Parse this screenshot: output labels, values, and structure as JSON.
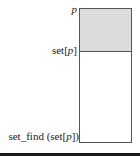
{
  "diagram": {
    "labels": {
      "top": "p",
      "middle_prefix": "set[",
      "middle_var": "p",
      "middle_suffix": "]",
      "bottom_prefix": "set_find (set[",
      "bottom_var": "p",
      "bottom_suffix": "])"
    },
    "colors": {
      "shaded": "#dcdcdc",
      "border": "#555555"
    }
  }
}
